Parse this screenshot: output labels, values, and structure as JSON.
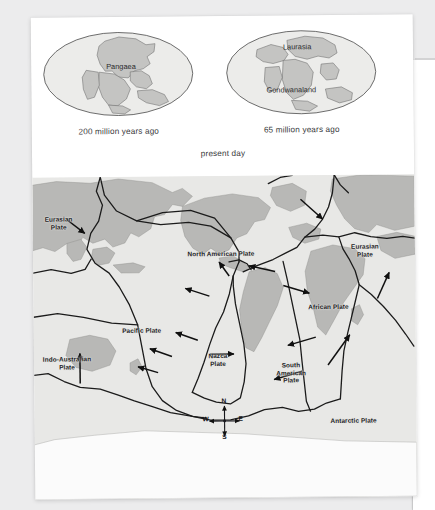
{
  "document": {
    "type": "textbook-figure-page",
    "background_color": "#ececed",
    "page_color": "#ffffff"
  },
  "figure_top": {
    "globes": [
      {
        "name": "pangaea-globe",
        "label": "Pangaea",
        "caption": "200 million years ago"
      },
      {
        "name": "laurasia-gondwanaland-globe",
        "labels": [
          "Laurasia",
          "Gondwanaland"
        ],
        "label_north": "Laurasia",
        "label_south": "Gondwanaland",
        "caption": "65 million years ago"
      }
    ],
    "present_day_caption": "present day"
  },
  "map": {
    "title": "present day",
    "ocean_color": "#e8e8e6",
    "land_color": "#b9b9b7",
    "boundary_color": "#1b1b1b",
    "plates": [
      {
        "name": "eurasian-plate-west",
        "label": "Eurasian\nPlate",
        "x": 12,
        "y": 42
      },
      {
        "name": "north-american-plate",
        "label": "North American Plate",
        "x": 176,
        "y": 78
      },
      {
        "name": "eurasian-plate-east",
        "label": "Eurasian\nPlate",
        "x": 330,
        "y": 72
      },
      {
        "name": "pacific-plate",
        "label": "Pacific Plate",
        "x": 105,
        "y": 153
      },
      {
        "name": "african-plate",
        "label": "African Plate",
        "x": 292,
        "y": 132
      },
      {
        "name": "nazca-plate",
        "label": "Nazca\nPlate",
        "x": 185,
        "y": 180
      },
      {
        "name": "south-american-plate",
        "label": "South\nAmerican\nPlate",
        "x": 256,
        "y": 190
      },
      {
        "name": "indo-australian-plate",
        "label": "Indo-Australian\nPlate",
        "x": 16,
        "y": 181
      },
      {
        "name": "antarctic-plate",
        "label": "Antarctic Plate",
        "x": 318,
        "y": 245
      }
    ],
    "compass": {
      "north": "N",
      "south": "S",
      "east": "E",
      "west": "W"
    },
    "motion_arrows_count": 14
  }
}
